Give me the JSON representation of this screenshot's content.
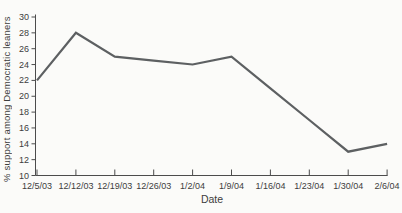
{
  "figure": {
    "background": "#fbfbf9",
    "line_color": "#5d6062",
    "axis_color": "#4c4c4c",
    "text_color": "#3d3d3d"
  },
  "chart_data": {
    "type": "line",
    "xlabel": "Date",
    "ylabel": "% support among Democratic leaners",
    "categories": [
      "12/5/03",
      "12/12/03",
      "12/19/03",
      "12/26/03",
      "1/2/04",
      "1/9/04",
      "1/16/04",
      "1/23/04",
      "1/30/04",
      "2/6/04"
    ],
    "values": [
      22,
      28,
      25,
      24.5,
      24,
      25,
      21,
      17,
      13,
      14
    ],
    "ylim": [
      10,
      30
    ],
    "ytick_step": 2,
    "grid": false,
    "legend": "none"
  }
}
